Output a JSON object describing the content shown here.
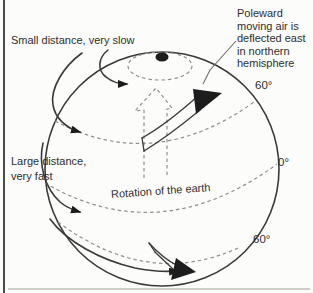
{
  "figure": {
    "labels": {
      "small_distance": "Small distance, very slow",
      "large_distance_line1": "Large distance,",
      "large_distance_line2": "very fast",
      "poleward_note": "Poleward moving air is deflected east in northern hemisphere",
      "rotation": "Rotation of the earth",
      "latitudes": {
        "north_60": "60°",
        "equator": "0°",
        "south_60": "60°"
      }
    },
    "colors": {
      "bg": "#fcfcfa",
      "line": "#3a3a3a",
      "dash": "#8f8f8f",
      "text": "#2e2e2e",
      "border": "#4b4b4b",
      "faint": "#cfcfca"
    }
  }
}
